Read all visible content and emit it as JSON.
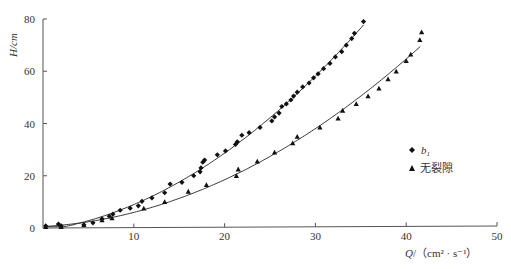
{
  "chart_data": {
    "type": "scatter",
    "title": "",
    "xlabel": "Q/(cm² · s⁻¹)",
    "ylabel": "H/cm",
    "xlim": [
      0,
      50
    ],
    "ylim": [
      0,
      80
    ],
    "xticks": [
      10,
      20,
      30,
      40,
      50
    ],
    "yticks": [
      0,
      20,
      40,
      60,
      80
    ],
    "grid": false,
    "legend_position": "right-middle",
    "series": [
      {
        "name": "b1",
        "marker": "diamond",
        "fit_line": true,
        "points": [
          [
            0.3,
            0.8
          ],
          [
            1.7,
            1.5
          ],
          [
            2.0,
            0.8
          ],
          [
            4.5,
            1.2
          ],
          [
            5.5,
            2.0
          ],
          [
            6.5,
            3.5
          ],
          [
            7.3,
            4.5
          ],
          [
            7.7,
            5.3
          ],
          [
            8.5,
            6.8
          ],
          [
            9.6,
            7.6
          ],
          [
            10.5,
            8.5
          ],
          [
            10.9,
            10.2
          ],
          [
            12.0,
            11.5
          ],
          [
            13.4,
            13.5
          ],
          [
            14.0,
            16.8
          ],
          [
            15.3,
            17.5
          ],
          [
            16.6,
            20.0
          ],
          [
            17.3,
            21.5
          ],
          [
            17.4,
            23.0
          ],
          [
            17.6,
            25.2
          ],
          [
            17.8,
            26.0
          ],
          [
            19.2,
            28.0
          ],
          [
            20.1,
            29.5
          ],
          [
            21.2,
            32.0
          ],
          [
            21.4,
            33.0
          ],
          [
            21.9,
            35.5
          ],
          [
            22.7,
            36.5
          ],
          [
            23.9,
            38.5
          ],
          [
            25.2,
            41.0
          ],
          [
            25.5,
            42.5
          ],
          [
            26.0,
            44.0
          ],
          [
            26.3,
            46.5
          ],
          [
            26.8,
            47.5
          ],
          [
            27.3,
            49.0
          ],
          [
            27.6,
            50.5
          ],
          [
            28.0,
            52.0
          ],
          [
            28.6,
            54.0
          ],
          [
            29.3,
            55.5
          ],
          [
            29.8,
            57.5
          ],
          [
            30.3,
            59.0
          ],
          [
            30.9,
            61.0
          ],
          [
            31.6,
            63.0
          ],
          [
            32.2,
            65.5
          ],
          [
            32.9,
            67.5
          ],
          [
            33.4,
            70.0
          ],
          [
            34.0,
            72.5
          ],
          [
            34.3,
            74.5
          ],
          [
            35.3,
            79.0
          ]
        ]
      },
      {
        "name": "无裂隙",
        "marker": "triangle",
        "fit_line": true,
        "points": [
          [
            0.3,
            0.5
          ],
          [
            2.0,
            0.5
          ],
          [
            4.5,
            1.2
          ],
          [
            6.5,
            3.0
          ],
          [
            7.6,
            3.8
          ],
          [
            11.1,
            7.5
          ],
          [
            13.4,
            10.0
          ],
          [
            16.0,
            14.0
          ],
          [
            18.0,
            16.5
          ],
          [
            21.3,
            20.0
          ],
          [
            21.5,
            22.5
          ],
          [
            23.6,
            25.5
          ],
          [
            25.5,
            29.0
          ],
          [
            27.5,
            32.5
          ],
          [
            28.0,
            35.0
          ],
          [
            30.5,
            38.5
          ],
          [
            32.5,
            42.0
          ],
          [
            33.0,
            45.0
          ],
          [
            34.5,
            47.5
          ],
          [
            35.8,
            50.5
          ],
          [
            37.0,
            53.5
          ],
          [
            38.0,
            57.0
          ],
          [
            38.9,
            60.0
          ],
          [
            40.0,
            64.0
          ],
          [
            40.5,
            66.5
          ],
          [
            41.5,
            72.0
          ],
          [
            41.7,
            75.0
          ]
        ]
      }
    ]
  },
  "legend": {
    "items": [
      {
        "symbol": "◆",
        "label": "b",
        "sub": "1"
      },
      {
        "symbol": "▲",
        "label": "无裂隙"
      }
    ]
  },
  "axes": {
    "x_label_main": "Q",
    "x_label_unit": "/（cm² · s⁻¹）",
    "y_label": "H/cm",
    "x_tick_labels": [
      "10",
      "20",
      "30",
      "40",
      "50"
    ],
    "y_tick_labels": [
      "0",
      "20",
      "40",
      "60",
      "80"
    ]
  }
}
